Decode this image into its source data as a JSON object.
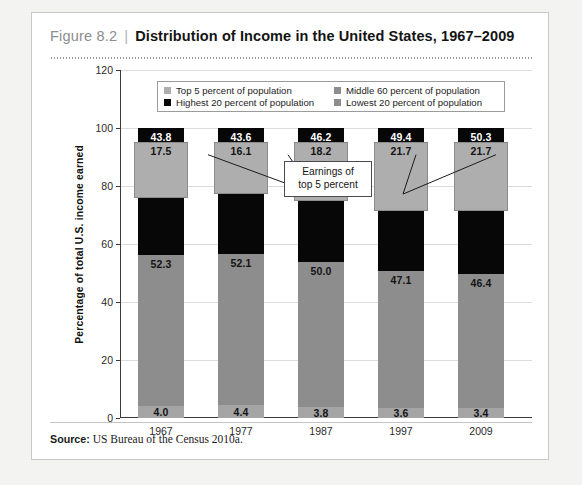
{
  "figure": {
    "number": "Figure 8.2",
    "separator": "|",
    "title": "Distribution of Income in the United States, 1967–2009",
    "source_label": "Source:",
    "source_text": "US Bureau of the Census 2010a."
  },
  "callout": {
    "line1": "Earnings of",
    "line2": "top 5 percent"
  },
  "colors": {
    "lowest20": "#a5a5a5",
    "middle60": "#8d8d8d",
    "highest20": "#070707",
    "top5": "#aeaeae",
    "grid": "#dcdcdc",
    "axis": "#3b3b3b"
  },
  "chart_data": {
    "type": "bar",
    "title": "Distribution of Income in the United States, 1967–2009",
    "xlabel": "",
    "ylabel": "Percentage of total U.S. income earned",
    "ylim": [
      0,
      120
    ],
    "yticks": [
      0,
      20,
      40,
      60,
      80,
      100,
      120
    ],
    "grid": true,
    "stacked": true,
    "legend_position": "top-center",
    "categories": [
      "1967",
      "1977",
      "1987",
      "1997",
      "2009"
    ],
    "series": [
      {
        "name": "Lowest 20 percent of population",
        "color": "#a5a5a5",
        "stacked": true,
        "values": [
          4.0,
          4.4,
          3.8,
          3.6,
          3.4
        ]
      },
      {
        "name": "Middle 60 percent of population",
        "color": "#8d8d8d",
        "stacked": true,
        "values": [
          52.3,
          52.1,
          50.0,
          47.1,
          46.4
        ]
      },
      {
        "name": "Highest 20 percent of population",
        "color": "#070707",
        "stacked": true,
        "values": [
          43.8,
          43.6,
          46.2,
          49.4,
          50.3
        ]
      },
      {
        "name": "Top 5 percent of population",
        "color": "#aeaeae",
        "overlay": true,
        "values": [
          17.5,
          16.1,
          18.2,
          21.7,
          21.7
        ]
      }
    ],
    "annotations": [
      {
        "text": "Earnings of top 5 percent",
        "points_to": "Top 5 percent overlay boxes"
      }
    ]
  },
  "legend": {
    "items": [
      {
        "label": "Top 5 percent of population",
        "color": "#aeaeae"
      },
      {
        "label": "Middle 60 percent of population",
        "color": "#8d8d8d"
      },
      {
        "label": "Highest 20 percent of population",
        "color": "#070707"
      },
      {
        "label": "Lowest 20 percent of population",
        "color": "#8d8d8d"
      }
    ]
  }
}
